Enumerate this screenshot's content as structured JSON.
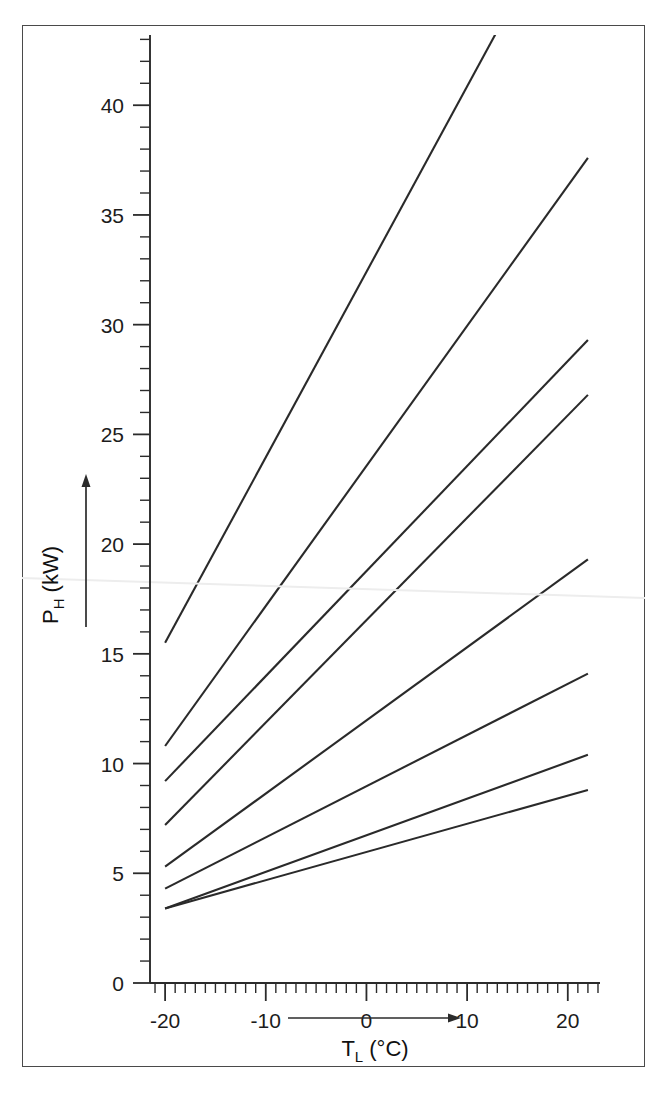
{
  "figure": {
    "background_color": "#ffffff",
    "frame_color": "#4a4a4a",
    "line_color": "#2a2a2a"
  },
  "axes": {
    "y": {
      "title_main": "P",
      "title_sub": "H",
      "title_unit": " (kW)",
      "title_full": "P_H (kW)",
      "tick_labels": [
        "0",
        "5",
        "10",
        "15",
        "20",
        "25",
        "30",
        "35",
        "40"
      ],
      "tick_values": [
        0,
        5,
        10,
        15,
        20,
        25,
        30,
        35,
        40
      ],
      "minor_step": 1,
      "range": [
        0,
        43.2
      ],
      "arrow_direction": "up"
    },
    "x": {
      "title_main": "T",
      "title_sub": "L",
      "title_unit": " (°C)",
      "title_full": "T_L (°C)",
      "tick_labels": [
        "-20",
        "-10",
        "0",
        "10",
        "20"
      ],
      "tick_values": [
        -20,
        -10,
        0,
        10,
        20
      ],
      "minor_step": 1,
      "range": [
        -21.5,
        23.2
      ],
      "arrow_direction": "right"
    }
  },
  "chart_data": {
    "type": "line",
    "title": "",
    "xlabel": "T_L (°C)",
    "ylabel": "P_H (kW)",
    "xlim": [
      -21.5,
      23.2
    ],
    "ylim": [
      0,
      43.2
    ],
    "grid": false,
    "legend": null,
    "x": [
      -20,
      22
    ],
    "series": [
      {
        "name": "line-1",
        "values": [
          15.5,
          51.0
        ],
        "clipped_at_top": true,
        "clip_y": 43.2,
        "clip_x": 14.6
      },
      {
        "name": "line-2",
        "values": [
          10.8,
          37.6
        ],
        "clipped_at_top": false
      },
      {
        "name": "line-3",
        "values": [
          9.2,
          29.3
        ],
        "clipped_at_top": false
      },
      {
        "name": "line-4",
        "values": [
          7.2,
          26.8
        ],
        "clipped_at_top": false
      },
      {
        "name": "line-5",
        "values": [
          5.3,
          19.3
        ],
        "clipped_at_top": false
      },
      {
        "name": "line-6",
        "values": [
          4.3,
          14.1
        ],
        "clipped_at_top": false
      },
      {
        "name": "line-7",
        "values": [
          3.4,
          10.4
        ],
        "clipped_at_top": false
      },
      {
        "name": "line-8",
        "values": [
          3.4,
          8.8
        ],
        "clipped_at_top": false
      }
    ]
  }
}
